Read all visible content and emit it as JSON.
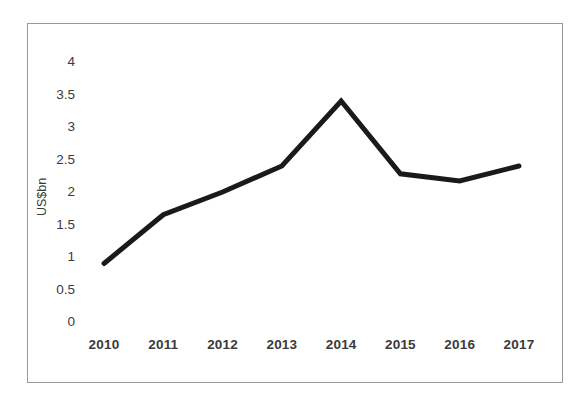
{
  "chart_data": {
    "type": "line",
    "title": "",
    "subtitle": "",
    "xlabel": "",
    "ylabel": "US$bn",
    "categories": [
      "2010",
      "2011",
      "2012",
      "2013",
      "2014",
      "2015",
      "2016",
      "2017"
    ],
    "x": [
      2010,
      2011,
      2012,
      2013,
      2014,
      2015,
      2016,
      2017
    ],
    "values": [
      0.9,
      1.65,
      2.0,
      2.4,
      3.4,
      2.28,
      2.17,
      2.4
    ],
    "series": [
      {
        "name": "US$bn",
        "values": [
          0.9,
          1.65,
          2.0,
          2.4,
          3.4,
          2.28,
          2.17,
          2.4
        ],
        "color": "#1a1a1a",
        "line_width": 5,
        "markers": false
      }
    ],
    "ylim": [
      0,
      4
    ],
    "yticks": [
      0,
      0.5,
      1,
      1.5,
      2,
      2.5,
      3,
      3.5,
      4
    ],
    "ytick_labels": [
      "0",
      "0.5",
      "1",
      "1.5",
      "2",
      "2.5",
      "3",
      "3.5",
      "4"
    ],
    "xtick_labels": [
      "2010",
      "2011",
      "2012",
      "2013",
      "2014",
      "2015",
      "2016",
      "2017"
    ],
    "grid": false,
    "legend": false,
    "legend_position": "none",
    "annotations": [],
    "frame_color": "#9a9a9a",
    "background_color": "#ffffff",
    "tick_label_color": "#3a3a3a"
  }
}
